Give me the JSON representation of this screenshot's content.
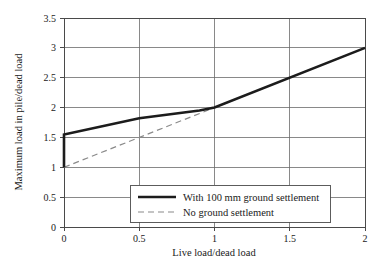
{
  "chart_data": {
    "type": "line",
    "title": "",
    "xlabel": "Live load/dead load",
    "ylabel": "Maximum load in pile/dead load",
    "xlim": [
      0,
      2
    ],
    "ylim": [
      0,
      3.5
    ],
    "xticks": [
      "0",
      "0.5",
      "1",
      "1.5",
      "2"
    ],
    "xtick_values": [
      0,
      0.5,
      1,
      1.5,
      2
    ],
    "yticks": [
      "0",
      "0.5",
      "1",
      "1.5",
      "2",
      "2.5",
      "3",
      "3.5"
    ],
    "ytick_values": [
      0,
      0.5,
      1,
      1.5,
      2,
      2.5,
      3,
      3.5
    ],
    "grid": true,
    "legend_position": "lower center",
    "series": [
      {
        "name": "With 100 mm ground settlement",
        "style": "solid",
        "color": "#1c1c1c",
        "x": [
          0,
          0,
          0.5,
          0.9,
          1,
          2
        ],
        "values": [
          1.0,
          1.55,
          1.82,
          1.95,
          2.0,
          3.0
        ]
      },
      {
        "name": "No ground settlement",
        "style": "dashed",
        "color": "#8a8a8a",
        "x": [
          0,
          1,
          2
        ],
        "values": [
          1.0,
          2.0,
          3.0
        ]
      }
    ]
  },
  "legend": {
    "entries": [
      {
        "label": "With 100 mm ground settlement",
        "style": "solid"
      },
      {
        "label": "No ground settlement",
        "style": "dashed"
      }
    ]
  }
}
